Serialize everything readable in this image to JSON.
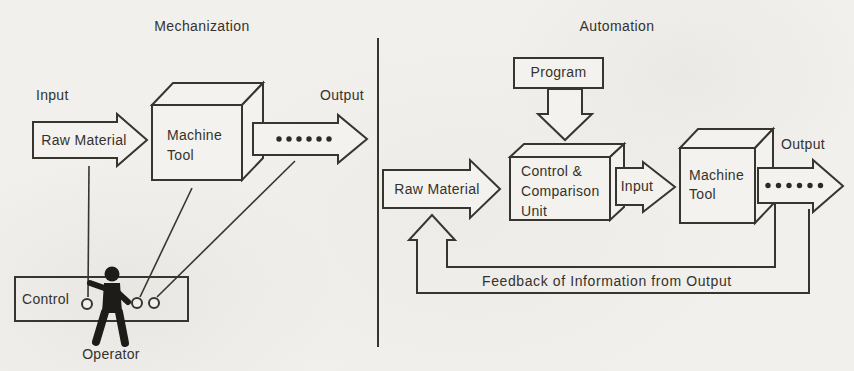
{
  "left_panel": {
    "title": "Mechanization",
    "input_label": "Input",
    "raw_material_label": "Raw Material",
    "machine_tool_label": "Machine Tool",
    "output_label": "Output",
    "control_label": "Control",
    "operator_label": "Operator"
  },
  "right_panel": {
    "title": "Automation",
    "program_label": "Program",
    "raw_material_label": "Raw Material",
    "control_unit_label": "Control & Comparison Unit",
    "input_label": "Input",
    "machine_tool_label": "Machine Tool",
    "output_label": "Output",
    "feedback_label": "Feedback of Information from Output"
  },
  "colors": {
    "paper": "#f1f0ed",
    "ink": "#38352f"
  }
}
